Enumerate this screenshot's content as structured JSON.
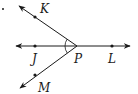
{
  "diagram": {
    "type": "geometry-rays",
    "vertex": "P",
    "points": [
      {
        "name": "K",
        "label": "K"
      },
      {
        "name": "J",
        "label": "J"
      },
      {
        "name": "P",
        "label": "P"
      },
      {
        "name": "L",
        "label": "L"
      },
      {
        "name": "M",
        "label": "M"
      }
    ],
    "rays": [
      "PK",
      "PJ",
      "PM",
      "PL"
    ],
    "marked_angles": [
      "KPJ",
      "JPM"
    ],
    "stroke_color": "#1a1a1a"
  }
}
